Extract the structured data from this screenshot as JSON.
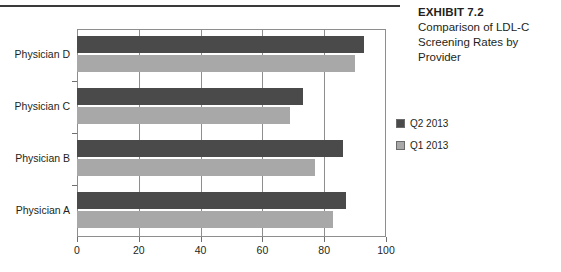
{
  "exhibit": {
    "title": "EXHIBIT 7.2",
    "subtitle": "Comparison of LDL-C Screening Rates by Provider"
  },
  "legend": {
    "position": "right",
    "items": [
      {
        "label": "Q2 2013",
        "color": "#4a4a4a",
        "name": "legend-q2-2013"
      },
      {
        "label": "Q1 2013",
        "color": "#a8a8a8",
        "name": "legend-q1-2013"
      }
    ]
  },
  "axis": {
    "x_ticks": [
      "0",
      "20",
      "40",
      "60",
      "80",
      "100"
    ],
    "y_labels": [
      "Physician D",
      "Physician C",
      "Physician B",
      "Physician A"
    ]
  },
  "chart_data": {
    "type": "bar",
    "orientation": "horizontal",
    "title": "Comparison of LDL-C Screening Rates by Provider",
    "xlabel": "",
    "ylabel": "",
    "xlim": [
      0,
      100
    ],
    "xticks": [
      0,
      20,
      40,
      60,
      80,
      100
    ],
    "grid": true,
    "legend_position": "right",
    "categories": [
      "Physician A",
      "Physician B",
      "Physician C",
      "Physician D"
    ],
    "series": [
      {
        "name": "Q2 2013",
        "color": "#4a4a4a",
        "values": [
          87,
          86,
          73,
          93
        ]
      },
      {
        "name": "Q1 2013",
        "color": "#a8a8a8",
        "values": [
          83,
          77,
          69,
          90
        ]
      }
    ]
  }
}
